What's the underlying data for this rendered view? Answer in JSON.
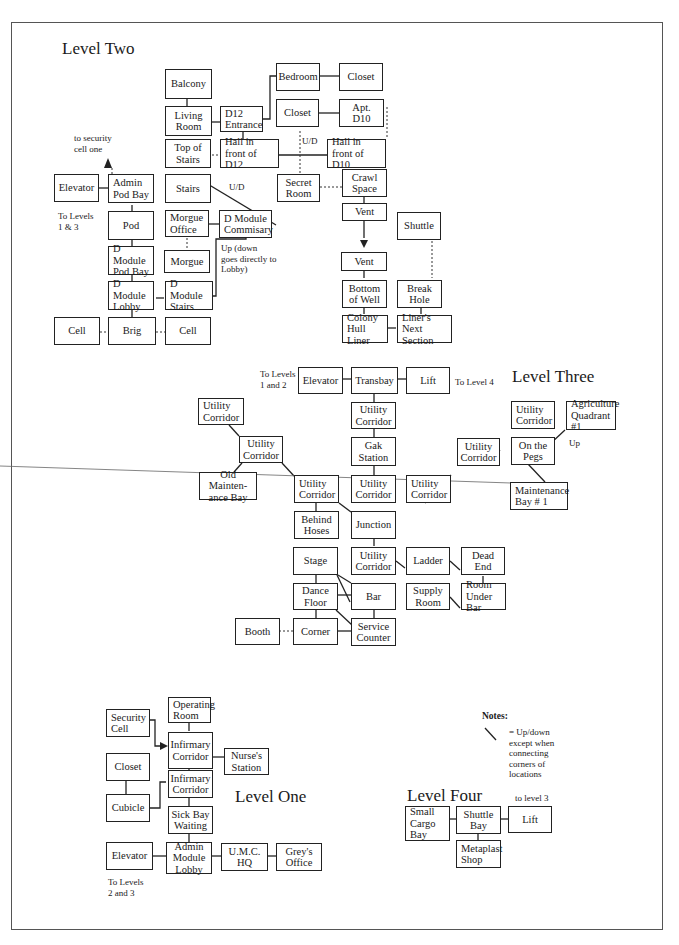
{
  "levels": {
    "two": {
      "title": "Level Two",
      "rooms": {
        "balcony": "Balcony",
        "living_room": "Living\nRoom",
        "d12_entrance": "D12\nEntrance",
        "bedroom": "Bedroom",
        "closet_a": "Closet",
        "closet_b": "Closet",
        "apt_d10": "Apt. D10",
        "top_of_stairs": "Top of\nStairs",
        "hall_d12": "Hall in\nfront of D12",
        "hall_d10": "Hall in\nfront of D10",
        "stairs": "Stairs",
        "secret_room": "Secret\nRoom",
        "crawl_space": "Crawl\nSpace",
        "elevator": "Elevator",
        "admin_pod_bay": "Admin\nPod Bay",
        "pod": "Pod",
        "morgue_office": "Morgue\nOffice",
        "d_module_commisary": "D Module\nCommisary",
        "vent_a": "Vent",
        "vent_b": "Vent",
        "shuttle": "Shuttle",
        "morgue": "Morgue",
        "d_module_pod_bay": "D Module\nPod Bay",
        "d_module_lobby": "D Module\nLobby",
        "d_module_stairs": "D Module\nStairs",
        "bottom_of_well": "Bottom\nof Well",
        "break_hole": "Break\nHole",
        "colony_hull_liner": "Colony\nHull Liner",
        "liners_next_section": "Liner's Next\nSection",
        "cell_left": "Cell",
        "brig": "Brig",
        "cell_right": "Cell"
      },
      "notes": {
        "to_security": "to security\ncell one",
        "to_levels": "To Levels\n1 & 3",
        "ud_1": "U/D",
        "ud_2": "U/D",
        "commisary_note": "Up (down\ngoes directly to\nLobby)"
      }
    },
    "three": {
      "title": "Level Three",
      "rooms": {
        "elevator": "Elevator",
        "transbay": "Transbay",
        "lift": "Lift",
        "uc_top": "Utility\nCorridor",
        "gak_station": "Gak\nStation",
        "uc_center": "Utility\nCorridor",
        "uc_far_left": "Utility\nCorridor",
        "uc_left_mid": "Utility\nCorridor",
        "old_maint_bay": "Old Mainten-\nance Bay",
        "uc_left_low": "Utility\nCorridor",
        "uc_right_low": "Utility\nCorridor",
        "uc_right_mid": "Utility\nCorridor",
        "uc_right_top": "Utility\nCorridor",
        "agri_quadrant": "Agriculture\nQuadrant #1",
        "on_the_pegs": "On the\nPegs",
        "maint_bay_1": "Maintenance\nBay  # 1",
        "behind_hoses": "Behind\nHoses",
        "junction": "Junction",
        "stage": "Stage",
        "uc_bar": "Utility\nCorridor",
        "ladder": "Ladder",
        "dead_end": "Dead\nEnd",
        "dance_floor": "Dance\nFloor",
        "bar": "Bar",
        "supply_room": "Supply\nRoom",
        "room_under_bar": "Room\nUnder Bar",
        "booth": "Booth",
        "corner": "Corner",
        "service_counter": "Service\nCounter"
      },
      "notes": {
        "to_levels": "To Levels\n1 and 2",
        "to_level4": "To Level 4",
        "up": "Up"
      }
    },
    "one": {
      "title": "Level One",
      "rooms": {
        "operating_room": "Operating\nRoom",
        "security_cell": "Security\nCell",
        "infirmary_corridor_a": "Infirmary\nCorridor",
        "nurses_station": "Nurse's\nStation",
        "closet": "Closet",
        "infirmary_corridor_b": "Infirmary\nCorridor",
        "cubicle": "Cubicle",
        "sick_bay_waiting": "Sick Bay\nWaiting",
        "elevator": "Elevator",
        "admin_module_lobby": "Admin\nModule\nLobby",
        "umc_hq": "U.M.C.\nHQ",
        "greys_office": "Grey's\nOffice"
      },
      "notes": {
        "to_levels": "To Levels\n2 and 3"
      }
    },
    "four": {
      "title": "Level Four",
      "rooms": {
        "small_cargo_bay": "Small\nCargo\nBay",
        "shuttle_bay": "Shuttle\nBay",
        "lift": "Lift",
        "metaplast_shop": "Metaplast\nShop"
      },
      "notes": {
        "to_level3": "to level 3"
      }
    }
  },
  "legend": {
    "heading": "Notes:",
    "text": "= Up/down\nexcept when\nconnecting\ncorners of\nlocations"
  }
}
